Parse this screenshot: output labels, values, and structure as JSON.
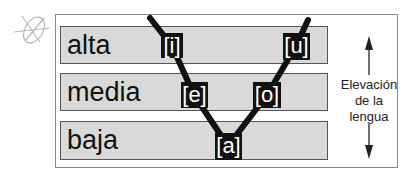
{
  "diagram": {
    "type": "vowel-height-chart",
    "levels": [
      {
        "id": "alta",
        "label": "alta"
      },
      {
        "id": "media",
        "label": "media"
      },
      {
        "id": "baja",
        "label": "baja"
      }
    ],
    "vowels": [
      {
        "symbol": "[i]",
        "level": "alta",
        "side": "front"
      },
      {
        "symbol": "[u]",
        "level": "alta",
        "side": "back"
      },
      {
        "symbol": "[e]",
        "level": "media",
        "side": "front"
      },
      {
        "symbol": "[o]",
        "level": "media",
        "side": "back"
      },
      {
        "symbol": "[a]",
        "level": "baja",
        "side": "central"
      }
    ],
    "axis_label": "Elevación de la lengua",
    "axis_label_lines": [
      "Elevación",
      "de la",
      "lengua"
    ],
    "decoration": "sketch-doodle-icon",
    "colors": {
      "band_fill": "#d9d9d9",
      "vowel_box": "#111111",
      "vowel_text": "#ffffff",
      "line": "#111111"
    }
  }
}
